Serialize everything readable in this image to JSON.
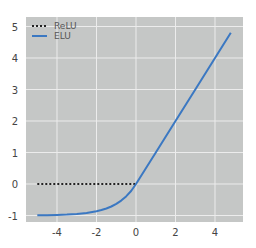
{
  "chart_data": {
    "type": "line",
    "title": "",
    "xlabel": "",
    "ylabel": "",
    "xlim": [
      -5.5,
      5.4
    ],
    "ylim": [
      -1.25,
      5.3
    ],
    "x_ticks": [
      -4,
      -2,
      0,
      2,
      4
    ],
    "y_ticks": [
      -1,
      0,
      1,
      2,
      3,
      4,
      5
    ],
    "grid": true,
    "legend_position": "upper-left",
    "background_color": "#c5c7c6",
    "grid_color": "#ececec",
    "series": [
      {
        "name": "ReLU",
        "style": "dotted",
        "color": "#222222",
        "x": [
          -5,
          0
        ],
        "y": [
          0,
          0
        ]
      },
      {
        "name": "ELU",
        "style": "solid",
        "color": "#3b78c2",
        "x": [
          -5,
          -4.5,
          -4,
          -3.5,
          -3,
          -2.5,
          -2,
          -1.75,
          -1.5,
          -1.25,
          -1,
          -0.75,
          -0.5,
          -0.25,
          0,
          1,
          2,
          3,
          4,
          4.8
        ],
        "y": [
          -0.993,
          -0.989,
          -0.982,
          -0.97,
          -0.95,
          -0.918,
          -0.865,
          -0.826,
          -0.777,
          -0.713,
          -0.632,
          -0.528,
          -0.393,
          -0.221,
          0,
          1,
          2,
          3,
          4,
          4.8
        ]
      }
    ]
  }
}
